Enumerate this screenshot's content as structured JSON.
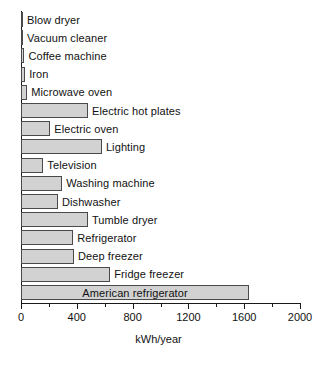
{
  "chart_data": {
    "type": "bar",
    "orientation": "horizontal",
    "title": "",
    "subtitle": "",
    "xlabel": "kWh/year",
    "ylabel": "",
    "xlim": [
      0,
      2000
    ],
    "xticks": [
      0,
      400,
      800,
      1200,
      1600,
      2000
    ],
    "xtick_labels": [
      "0",
      "400",
      "800",
      "1200",
      "1600",
      "2000"
    ],
    "minor_xticks": [
      200,
      600,
      1000,
      1400,
      1800
    ],
    "grid": false,
    "legend": false,
    "bar_fill_color": "#d2d2d2",
    "bar_edge_color": "#4a4a4a",
    "axis_color": "#1a1a1a",
    "categories": [
      "Blow dryer",
      "Vacuum cleaner",
      "Coffee machine",
      "Iron",
      "Microwave oven",
      "Electric hot plates",
      "Electric oven",
      "Lighting",
      "Television",
      "Washing machine",
      "Dishwasher",
      "Tumble dryer",
      "Refrigerator",
      "Deep freezer",
      "Fridge freezer",
      "American refrigerator"
    ],
    "values": [
      15,
      15,
      25,
      30,
      45,
      480,
      210,
      580,
      160,
      295,
      265,
      480,
      375,
      380,
      640,
      1635
    ],
    "label_placement": [
      "outside",
      "outside",
      "outside",
      "outside",
      "outside",
      "outside",
      "outside",
      "outside",
      "outside",
      "outside",
      "outside",
      "outside",
      "outside",
      "outside",
      "outside",
      "inside"
    ]
  }
}
